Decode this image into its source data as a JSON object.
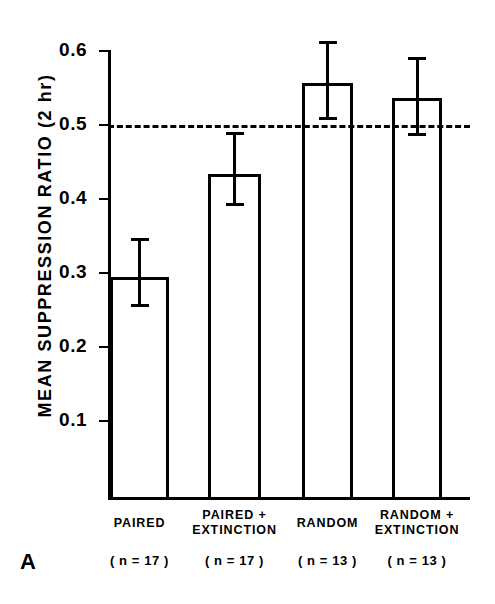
{
  "panel": {
    "label": "A"
  },
  "chart_data": {
    "type": "bar",
    "title": "",
    "subtitle": "",
    "xlabel": "",
    "ylabel": "MEAN SUPPRESSION RATIO (2 hr)",
    "ylim": [
      0.0,
      0.6
    ],
    "yticks": [
      "0.6",
      "0.5",
      "0.4",
      "0.3",
      "0.2",
      "0.1"
    ],
    "ytick_values": [
      0.6,
      0.5,
      0.4,
      0.3,
      0.2,
      0.1
    ],
    "grid": false,
    "legend": "none",
    "categories": [
      "PAIRED",
      "PAIRED +\nEXTINCTION",
      "RANDOM",
      "RANDOM +\nEXTINCTION"
    ],
    "group_n_labels": [
      "( n = 17 )",
      "( n = 17 )",
      "( n = 13 )",
      "( n = 13 )"
    ],
    "values": [
      0.295,
      0.433,
      0.556,
      0.535
    ],
    "err_upper": [
      0.347,
      0.49,
      0.612,
      0.59
    ],
    "err_lower": [
      0.255,
      0.39,
      0.506,
      0.485
    ],
    "reference_line": {
      "value": 0.5,
      "style": "dashed"
    },
    "bar_style": "open-outline",
    "colors": {
      "line": "#000000",
      "fill": "#ffffff",
      "background": "#ffffff"
    }
  }
}
